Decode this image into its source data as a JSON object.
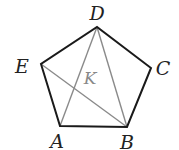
{
  "diagram": {
    "type": "geometry",
    "shape": "pentagon",
    "colors": {
      "edge": "#1a1a1a",
      "diagonal": "#8a8a8a",
      "label": "#222222",
      "inner_label": "#888888"
    },
    "vertices": {
      "A": {
        "label": "A",
        "x": 60,
        "y": 126,
        "lx": 57,
        "ly": 148
      },
      "B": {
        "label": "B",
        "x": 127,
        "y": 127,
        "lx": 127,
        "ly": 149
      },
      "C": {
        "label": "C",
        "x": 151,
        "y": 68,
        "lx": 163,
        "ly": 75
      },
      "D": {
        "label": "D",
        "x": 97,
        "y": 27,
        "lx": 97,
        "ly": 20
      },
      "E": {
        "label": "E",
        "x": 41,
        "y": 64,
        "lx": 22,
        "ly": 73
      }
    },
    "edges": [
      [
        "A",
        "B"
      ],
      [
        "B",
        "C"
      ],
      [
        "C",
        "D"
      ],
      [
        "D",
        "E"
      ],
      [
        "E",
        "A"
      ]
    ],
    "diagonals": [
      [
        "D",
        "A"
      ],
      [
        "D",
        "B"
      ],
      [
        "E",
        "B"
      ]
    ],
    "inner_point": {
      "label": "K",
      "x": 90,
      "y": 84
    }
  }
}
